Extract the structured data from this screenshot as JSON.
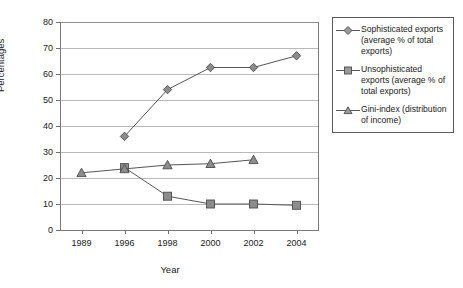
{
  "chart_data": {
    "type": "line",
    "title": "",
    "xlabel": "Year",
    "ylabel": "Percentages",
    "categories": [
      "1989",
      "1996",
      "1998",
      "2000",
      "2002",
      "2004"
    ],
    "ylim": [
      0,
      80
    ],
    "yticks": [
      0,
      10,
      20,
      30,
      40,
      50,
      60,
      70,
      80
    ],
    "grid": "horizontal",
    "legend_position": "right",
    "series": [
      {
        "name": "Sophisticated exports (average % of total exports)",
        "marker": "diamond",
        "color": "#8c8c8c",
        "line_color": "#555555",
        "values": [
          null,
          36,
          54,
          62.5,
          62.5,
          67
        ]
      },
      {
        "name": "Unsophisticated exports (average % of total exports)",
        "marker": "square",
        "color": "#8c8c8c",
        "line_color": "#555555",
        "values": [
          null,
          24,
          13,
          10,
          10,
          9.5
        ]
      },
      {
        "name": "Gini-index (distribution of income)",
        "marker": "triangle",
        "color": "#8c8c8c",
        "line_color": "#555555",
        "values": [
          22,
          23.5,
          25,
          25.5,
          27,
          null
        ]
      }
    ]
  },
  "legend": {
    "entries": [
      {
        "label": "Sophisticated exports (average % of total exports)",
        "marker": "diamond"
      },
      {
        "label": "Unsophisticated exports (average % of total exports)",
        "marker": "square"
      },
      {
        "label": "Gini-index (distribution of income)",
        "marker": "triangle"
      }
    ]
  },
  "axis_labels": {
    "y": "Percentages",
    "x": "Year"
  },
  "ytick_labels": [
    "0",
    "10",
    "20",
    "30",
    "40",
    "50",
    "60",
    "70",
    "80"
  ],
  "xtick_labels": [
    "1989",
    "1996",
    "1998",
    "2000",
    "2002",
    "2004"
  ]
}
